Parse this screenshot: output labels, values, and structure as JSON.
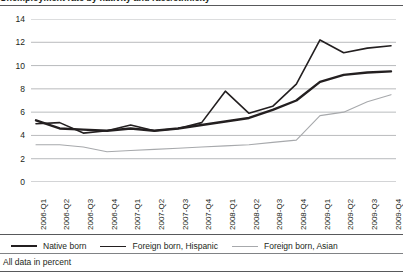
{
  "figure": {
    "title_cropped": "Unemployment rate by nativity and race/ethnicity",
    "footnote": "All data in percent"
  },
  "legend": {
    "position": "bottom",
    "items": [
      {
        "label": "Native born",
        "color": "#231f20",
        "swatch": "line-swatch-thick"
      },
      {
        "label": "Foreign born, Hispanic",
        "color": "#231f20",
        "swatch": "line-swatch-medium"
      },
      {
        "label": "Foreign born, Asian",
        "color": "#a7a9ac",
        "swatch": "line-swatch-thin"
      }
    ]
  },
  "chart_data": {
    "type": "line",
    "title": "Unemployment rate by nativity and race/ethnicity",
    "xlabel": "",
    "ylabel": "",
    "ylim": [
      0,
      14
    ],
    "yticks": [
      0,
      2,
      4,
      6,
      8,
      10,
      12,
      14
    ],
    "ytick_labels": [
      "0",
      "2",
      "4",
      "6",
      "8",
      "10",
      "12",
      "14"
    ],
    "grid": true,
    "grid_axis": "y",
    "legend_position": "bottom",
    "categories": [
      "2006-Q1",
      "2006-Q2",
      "2006-Q3",
      "2006-Q4",
      "2007-Q1",
      "2007-Q2",
      "2007-Q3",
      "2007-Q4",
      "2008-Q1",
      "2008-Q2",
      "2008-Q3",
      "2008-Q4",
      "2009-Q1",
      "2009-Q2",
      "2009-Q3",
      "2009-Q4"
    ],
    "series": [
      {
        "name": "Native born",
        "color": "#231f20",
        "width": 2.4,
        "values": [
          5.3,
          4.6,
          4.5,
          4.4,
          4.6,
          4.4,
          4.6,
          4.9,
          5.2,
          5.5,
          6.2,
          7.0,
          8.6,
          9.2,
          9.4,
          9.5
        ]
      },
      {
        "name": "Foreign born, Hispanic",
        "color": "#231f20",
        "width": 1.6,
        "values": [
          5.0,
          5.1,
          4.2,
          4.4,
          4.9,
          4.4,
          4.6,
          5.1,
          7.8,
          5.9,
          6.5,
          8.4,
          12.2,
          11.1,
          11.5,
          11.7
        ]
      },
      {
        "name": "Foreign born, Asian",
        "color": "#a7a9ac",
        "width": 1.1,
        "values": [
          3.2,
          3.2,
          3.0,
          2.6,
          2.7,
          2.8,
          2.9,
          3.0,
          3.1,
          3.2,
          3.4,
          3.6,
          5.7,
          6.0,
          6.9,
          7.5
        ]
      }
    ]
  }
}
